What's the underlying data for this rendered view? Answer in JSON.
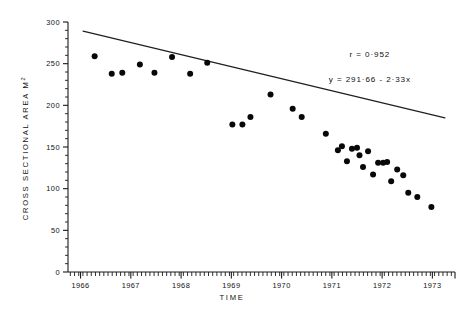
{
  "chart_data": {
    "type": "scatter",
    "title": "",
    "xlabel": "TIME",
    "ylabel": "CROSS SECTIONAL AREA  M2",
    "ylabel_base": "CROSS  SECTIONAL  AREA   M",
    "ylabel_exponent": "2",
    "xlim": [
      1965.75,
      1973.45
    ],
    "ylim": [
      0,
      300
    ],
    "x_ticks": [
      1966,
      1967,
      1968,
      1969,
      1970,
      1971,
      1972,
      1973
    ],
    "x_tick_labels": [
      "1966",
      "1967",
      "1968",
      "1969",
      "1970",
      "1971",
      "1972",
      "1973"
    ],
    "x_minor_interval": 0.0833,
    "y_ticks": [
      0,
      50,
      100,
      150,
      200,
      250,
      300
    ],
    "y_tick_labels": [
      "0",
      "50",
      "100",
      "150",
      "200",
      "250",
      "300"
    ],
    "y_minor_interval": 10,
    "grid": false,
    "legend": null,
    "marker": "filled-circle",
    "marker_color": "#080808",
    "line_color": "#1f1f1f",
    "annotations": [
      {
        "name": "correlation",
        "text": "r = 0·952",
        "x": 0.78,
        "y": 0.86
      },
      {
        "name": "regression-equation",
        "text": "y = 291·66 - 2·33x",
        "x": 0.78,
        "y": 0.76
      }
    ],
    "regression": {
      "intercept": 291.66,
      "slope": -2.33,
      "r": 0.952,
      "x_start": 1966.05,
      "x_end": 1973.25,
      "y_start": 289.0,
      "y_end": 185.0
    },
    "points": [
      {
        "x": 1966.28,
        "y": 259
      },
      {
        "x": 1966.62,
        "y": 238
      },
      {
        "x": 1966.83,
        "y": 239
      },
      {
        "x": 1967.18,
        "y": 249
      },
      {
        "x": 1967.47,
        "y": 239
      },
      {
        "x": 1967.82,
        "y": 258
      },
      {
        "x": 1968.18,
        "y": 238
      },
      {
        "x": 1968.52,
        "y": 251
      },
      {
        "x": 1969.02,
        "y": 177
      },
      {
        "x": 1969.22,
        "y": 177
      },
      {
        "x": 1969.38,
        "y": 186
      },
      {
        "x": 1969.78,
        "y": 213
      },
      {
        "x": 1970.22,
        "y": 196
      },
      {
        "x": 1970.4,
        "y": 186
      },
      {
        "x": 1970.88,
        "y": 166
      },
      {
        "x": 1971.12,
        "y": 146
      },
      {
        "x": 1971.2,
        "y": 151
      },
      {
        "x": 1971.3,
        "y": 133
      },
      {
        "x": 1971.4,
        "y": 148
      },
      {
        "x": 1971.5,
        "y": 149
      },
      {
        "x": 1971.55,
        "y": 140
      },
      {
        "x": 1971.62,
        "y": 126
      },
      {
        "x": 1971.72,
        "y": 145
      },
      {
        "x": 1971.82,
        "y": 117
      },
      {
        "x": 1971.92,
        "y": 131
      },
      {
        "x": 1972.02,
        "y": 131
      },
      {
        "x": 1972.1,
        "y": 132
      },
      {
        "x": 1972.18,
        "y": 109
      },
      {
        "x": 1972.3,
        "y": 123
      },
      {
        "x": 1972.42,
        "y": 116
      },
      {
        "x": 1972.52,
        "y": 95
      },
      {
        "x": 1972.7,
        "y": 90
      },
      {
        "x": 1972.98,
        "y": 78
      }
    ]
  }
}
